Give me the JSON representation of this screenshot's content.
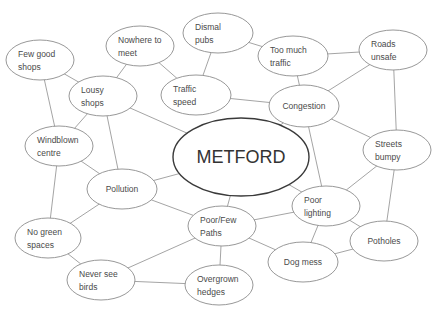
{
  "diagram": {
    "title": "METFORD",
    "type": "mind-map",
    "central_node": {
      "id": "metford",
      "label": "METFORD",
      "cx": 241,
      "cy": 157,
      "rx": 68,
      "ry": 39
    },
    "nodes": [
      {
        "id": "few-good-shops",
        "lines": [
          "Few good",
          "shops"
        ],
        "cx": 40,
        "cy": 60,
        "rx": 34,
        "ry": 20
      },
      {
        "id": "nowhere-to-meet",
        "lines": [
          "Nowhere to",
          "meet"
        ],
        "cx": 140,
        "cy": 46,
        "rx": 34,
        "ry": 20
      },
      {
        "id": "dismal-pubs",
        "lines": [
          "Dismal",
          "pubs"
        ],
        "cx": 218,
        "cy": 33,
        "rx": 35,
        "ry": 20
      },
      {
        "id": "too-much-traffic",
        "lines": [
          "Too much",
          "traffic"
        ],
        "cx": 293,
        "cy": 56,
        "rx": 35,
        "ry": 20
      },
      {
        "id": "roads-unsafe",
        "lines": [
          "Roads",
          "unsafe"
        ],
        "cx": 393,
        "cy": 50,
        "rx": 34,
        "ry": 20
      },
      {
        "id": "lousy-shops",
        "lines": [
          "Lousy",
          "shops"
        ],
        "cx": 103,
        "cy": 96,
        "rx": 34,
        "ry": 20
      },
      {
        "id": "traffic-speed",
        "lines": [
          "Traffic",
          "speed"
        ],
        "cx": 196,
        "cy": 95,
        "rx": 35,
        "ry": 20
      },
      {
        "id": "congestion",
        "lines": [
          "Congestion"
        ],
        "cx": 304,
        "cy": 106,
        "rx": 35,
        "ry": 21
      },
      {
        "id": "windblown-centre",
        "lines": [
          "Windblown",
          "centre"
        ],
        "cx": 59,
        "cy": 146,
        "rx": 34,
        "ry": 20
      },
      {
        "id": "streets-bumpy",
        "lines": [
          "Streets",
          "bumpy"
        ],
        "cx": 397,
        "cy": 150,
        "rx": 34,
        "ry": 20
      },
      {
        "id": "pollution",
        "lines": [
          "Pollution"
        ],
        "cx": 122,
        "cy": 189,
        "rx": 35,
        "ry": 20
      },
      {
        "id": "poor-lighting",
        "lines": [
          "Poor",
          "lighting"
        ],
        "cx": 326,
        "cy": 206,
        "rx": 34,
        "ry": 20
      },
      {
        "id": "no-green-spaces",
        "lines": [
          "No green",
          "spaces"
        ],
        "cx": 48,
        "cy": 238,
        "rx": 33,
        "ry": 20
      },
      {
        "id": "poor-few-paths",
        "lines": [
          "Poor/Few",
          "Paths"
        ],
        "cx": 222,
        "cy": 226,
        "rx": 34,
        "ry": 20
      },
      {
        "id": "potholes",
        "lines": [
          "Potholes"
        ],
        "cx": 384,
        "cy": 241,
        "rx": 34,
        "ry": 20
      },
      {
        "id": "dog-mess",
        "lines": [
          "Dog mess"
        ],
        "cx": 303,
        "cy": 262,
        "rx": 35,
        "ry": 20
      },
      {
        "id": "never-see-birds",
        "lines": [
          "Never see",
          "birds"
        ],
        "cx": 101,
        "cy": 280,
        "rx": 34,
        "ry": 20
      },
      {
        "id": "overgrown-hedges",
        "lines": [
          "Overgrown",
          "hedges"
        ],
        "cx": 219,
        "cy": 285,
        "rx": 34,
        "ry": 20
      }
    ],
    "edges": [
      [
        "few-good-shops",
        "lousy-shops"
      ],
      [
        "few-good-shops",
        "windblown-centre"
      ],
      [
        "nowhere-to-meet",
        "lousy-shops"
      ],
      [
        "nowhere-to-meet",
        "traffic-speed"
      ],
      [
        "dismal-pubs",
        "traffic-speed"
      ],
      [
        "dismal-pubs",
        "too-much-traffic"
      ],
      [
        "too-much-traffic",
        "roads-unsafe"
      ],
      [
        "too-much-traffic",
        "congestion"
      ],
      [
        "roads-unsafe",
        "congestion"
      ],
      [
        "roads-unsafe",
        "streets-bumpy"
      ],
      [
        "lousy-shops",
        "metford"
      ],
      [
        "lousy-shops",
        "windblown-centre"
      ],
      [
        "lousy-shops",
        "pollution"
      ],
      [
        "traffic-speed",
        "congestion"
      ],
      [
        "congestion",
        "metford"
      ],
      [
        "congestion",
        "streets-bumpy"
      ],
      [
        "congestion",
        "poor-lighting"
      ],
      [
        "windblown-centre",
        "pollution"
      ],
      [
        "windblown-centre",
        "no-green-spaces"
      ],
      [
        "metford",
        "pollution"
      ],
      [
        "metford",
        "poor-lighting"
      ],
      [
        "metford",
        "poor-few-paths"
      ],
      [
        "streets-bumpy",
        "poor-lighting"
      ],
      [
        "streets-bumpy",
        "potholes"
      ],
      [
        "pollution",
        "no-green-spaces"
      ],
      [
        "pollution",
        "poor-few-paths"
      ],
      [
        "poor-lighting",
        "poor-few-paths"
      ],
      [
        "poor-lighting",
        "potholes"
      ],
      [
        "poor-lighting",
        "dog-mess"
      ],
      [
        "no-green-spaces",
        "never-see-birds"
      ],
      [
        "poor-few-paths",
        "never-see-birds"
      ],
      [
        "poor-few-paths",
        "overgrown-hedges"
      ],
      [
        "poor-few-paths",
        "dog-mess"
      ],
      [
        "never-see-birds",
        "overgrown-hedges"
      ],
      [
        "dog-mess",
        "potholes"
      ]
    ],
    "colors": {
      "background": "#ffffff",
      "edge": "#9a9a9a",
      "node_border": "#8c8c8c",
      "central_border": "#3a3a3a",
      "text": "#4a4a4a"
    }
  },
  "caption": {
    "text": "Figure 2 (clipped caption, illegible)"
  }
}
